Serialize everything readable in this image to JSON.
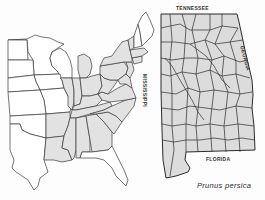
{
  "figure": {
    "type": "species distribution map",
    "species_name": "Prunus persica",
    "colors": {
      "shaded_fill": "#e2e2e2",
      "unshaded_fill": "#ffffff",
      "border": "#3a3a3a"
    }
  },
  "us_map": {
    "region": "Eastern United States",
    "shaded_states": [
      "Pennsylvania",
      "New York",
      "New Jersey",
      "Connecticut",
      "Massachusetts",
      "Vermont",
      "Ohio",
      "Indiana",
      "Illinois",
      "Kentucky",
      "West Virginia",
      "Virginia",
      "Maryland",
      "Delaware",
      "North Carolina",
      "Tennessee",
      "South Carolina",
      "Georgia",
      "Alabama",
      "Mississippi",
      "Louisiana",
      "Arkansas",
      "Michigan (lower)"
    ],
    "unshaded_states": [
      "Minnesota",
      "Wisconsin",
      "Iowa",
      "Missouri",
      "Nebraska",
      "Kansas",
      "Oklahoma",
      "Texas",
      "Maine",
      "New Hampshire",
      "Florida"
    ]
  },
  "alabama_map": {
    "labels": {
      "north": "TENNESSEE",
      "west": "MISSISSIPPI",
      "east": "GEORGIA",
      "south": "FLORIDA"
    }
  }
}
